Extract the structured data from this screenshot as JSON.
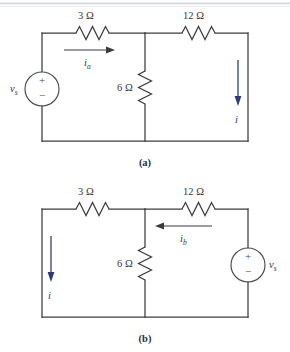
{
  "figures": [
    {
      "id": "circuit-a",
      "caption": "(a)",
      "components": {
        "r_series": "3 Ω",
        "r_shunt": "6 Ω",
        "r_right": "12 Ω",
        "source": "v",
        "source_sub": "s",
        "source_plus": "+",
        "source_minus": "−"
      },
      "currents": [
        {
          "name": "i",
          "sub": "a",
          "direction": "right",
          "color": "#3b3b42"
        },
        {
          "name": "i",
          "sub": "",
          "direction": "down",
          "color": "#2b3a78"
        }
      ]
    },
    {
      "id": "circuit-b",
      "caption": "(b)",
      "components": {
        "r_series": "3 Ω",
        "r_shunt": "6 Ω",
        "r_right": "12 Ω",
        "source": "v",
        "source_sub": "s",
        "source_plus": "+",
        "source_minus": "−"
      },
      "currents": [
        {
          "name": "i",
          "sub": "b",
          "direction": "left",
          "color": "#3b3b42"
        },
        {
          "name": "i",
          "sub": "",
          "direction": "down",
          "color": "#2b3a78"
        }
      ]
    }
  ],
  "colors": {
    "wire": "#3b3b42",
    "current_blue": "#2b3a78",
    "background": "#ffffff"
  }
}
